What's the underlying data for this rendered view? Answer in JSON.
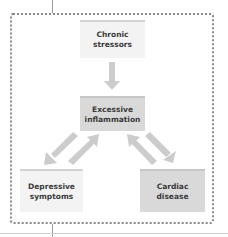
{
  "diagram": {
    "nodes": {
      "chronic_stressors": {
        "line1": "Chronic",
        "line2": "stressors"
      },
      "excessive_inflammation": {
        "line1": "Excessive",
        "line2": "inflammation"
      },
      "depressive_symptoms": {
        "line1": "Depressive",
        "line2": "symptoms"
      },
      "cardiac_disease": {
        "line1": "Cardiac",
        "line2": "disease"
      }
    },
    "edges": [
      {
        "from": "Chronic stressors",
        "to": "Excessive inflammation",
        "direction": "one-way"
      },
      {
        "from": "Excessive inflammation",
        "to": "Depressive symptoms",
        "direction": "bidirectional"
      },
      {
        "from": "Excessive inflammation",
        "to": "Cardiac disease",
        "direction": "bidirectional"
      }
    ],
    "colors": {
      "light_box": "#f3f3f3",
      "dark_box": "#d9d9d9",
      "arrow": "#cccccc",
      "frame_border": "#8a8a8a",
      "text": "#3a3a3a"
    }
  }
}
